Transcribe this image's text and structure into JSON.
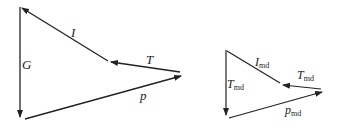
{
  "diagram_left": {
    "title": "vector triangle",
    "labels": {
      "G": "G",
      "I": "I",
      "T": "T",
      "p": "p"
    }
  },
  "diagram_right": {
    "title": "vector triangle md",
    "labels": {
      "T_left": "T",
      "T_left_sub": "md",
      "I": "I",
      "I_sub": "md",
      "T_right": "T",
      "T_right_sub": "md",
      "p": "p",
      "p_sub": "md"
    }
  },
  "colors": {
    "stroke": "#222222",
    "background": "#ffffff"
  }
}
